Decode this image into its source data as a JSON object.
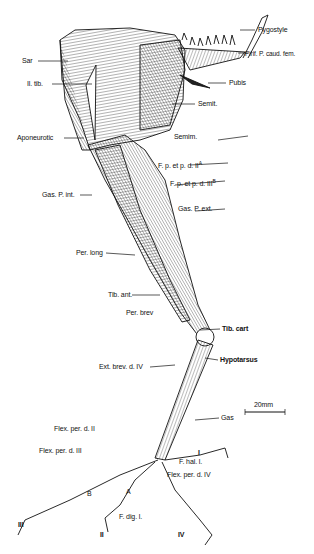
{
  "figure": {
    "scale_bar": {
      "label": "20mm"
    },
    "labels": {
      "pygostyle": "Pygostyle",
      "pirif": "Pirif. P. caud. fem.",
      "pubis": "Pubis",
      "semit": "Semit.",
      "semim": "Semim.",
      "sar": "Sar",
      "il_tib": "Il. tib.",
      "aponeurotic": "Aponeurotic",
      "fpd2": "F. p. et p. d. II",
      "fpd2_sup": "A",
      "fpd3": "F. p. et p. d. III",
      "fpd3_sup": "B",
      "gas_p_int": "Gas. P. int.",
      "gas_p_ext": "Gas. P. ext.",
      "per_long": "Per. long",
      "tib_ant": "Tib. ant.",
      "per_brev": "Per. brev",
      "tib_cart": "Tib. cart",
      "hypotarsus": "Hypotarsus",
      "ext_brev": "Ext. brev. d. IV",
      "gas": "Gas",
      "flex_per_d2": "Flex. per. d. II",
      "flex_per_d3": "Flex. per. d. III",
      "flex_per_d4": "Flex. per. d. IV",
      "f_hal_l": "F. hal. l.",
      "f_dig_l": "F. dig. l.",
      "letter_a": "A",
      "letter_b": "B",
      "digit_1": "I",
      "digit_2": "II",
      "digit_3": "III",
      "digit_4": "IV"
    }
  }
}
